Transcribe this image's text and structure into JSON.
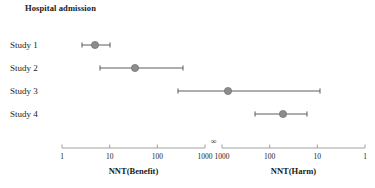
{
  "title": "Hospital admission",
  "chart_data": {
    "type": "scatter",
    "title": "Hospital admission",
    "xlabel": "",
    "ylabel": "",
    "grid": false,
    "legend": null,
    "axes": [
      {
        "name": "NNT(Benefit)",
        "side": "left",
        "scale": "log",
        "ticks": [
          "1",
          "10",
          "100",
          "1000"
        ],
        "tick_values": [
          1,
          10,
          100,
          1000
        ],
        "direction": "ascending",
        "px_start": 62,
        "px_end": 205
      },
      {
        "name": "NNT(Harm)",
        "side": "right",
        "scale": "log",
        "ticks": [
          "1000",
          "100",
          "10",
          "1"
        ],
        "tick_values": [
          1000,
          100,
          10,
          1
        ],
        "direction": "descending",
        "px_start": 222,
        "px_end": 365
      }
    ],
    "break_symbol": "∞",
    "categories": [
      "Study 1",
      "Study 2",
      "Study 3",
      "Study 4"
    ],
    "points": [
      {
        "label": "Study 1",
        "estimate": 5.5,
        "estimate_side": "benefit",
        "ci_low": 3,
        "ci_low_side": "benefit",
        "ci_high": 13,
        "ci_high_side": "benefit",
        "px_center": 95,
        "px_left": 82,
        "px_right": 110,
        "px_y": 45
      },
      {
        "label": "Study 2",
        "estimate": 33,
        "estimate_side": "benefit",
        "ci_low": 8,
        "ci_low_side": "benefit",
        "ci_high": 260,
        "ci_high_side": "benefit",
        "px_center": 135,
        "px_left": 100,
        "px_right": 183,
        "px_y": 68
      },
      {
        "label": "Study 3",
        "estimate": 620,
        "estimate_side": "benefit",
        "ci_low": 90,
        "ci_low_side": "benefit",
        "ci_high": 20,
        "ci_high_side": "harm",
        "px_center": 228,
        "px_left": 178,
        "px_right": 320,
        "px_y": 91
      },
      {
        "label": "Study 4",
        "estimate": 90,
        "estimate_side": "harm",
        "ci_low": 330,
        "ci_low_side": "harm",
        "ci_high": 25,
        "ci_high_side": "harm",
        "px_center": 283,
        "px_left": 255,
        "px_right": 307,
        "px_y": 114
      }
    ],
    "marker": {
      "shape": "circle",
      "color": "#8c8c8c",
      "edge_color": "#6e6e6e"
    },
    "line_color": "#4a4a4a"
  },
  "colors": {
    "marker": "#8c8c8c",
    "marker_edge": "#6e6e6e",
    "line": "#4a4a4a",
    "axis": "#8a8a8a",
    "text": "#1a1a1a",
    "background": "#ffffff"
  },
  "axis_labels": {
    "left": "NNT(Benefit)",
    "right": "NNT(Harm)"
  },
  "infinity_symbol": "∞",
  "ticks_left": [
    "1",
    "10",
    "100",
    "1000"
  ],
  "ticks_right": [
    "1000",
    "100",
    "10",
    "1"
  ],
  "studies": [
    {
      "label": "Study 1"
    },
    {
      "label": "Study 2"
    },
    {
      "label": "Study 3"
    },
    {
      "label": "Study 4"
    }
  ]
}
